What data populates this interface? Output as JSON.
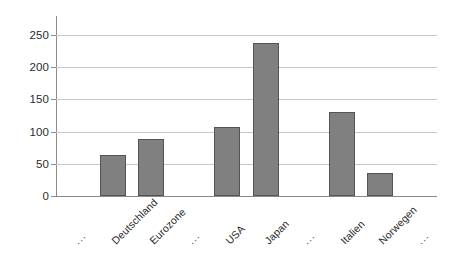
{
  "chart_data": {
    "type": "bar",
    "title": "",
    "subtitle": "",
    "xlabel": "",
    "ylabel": "",
    "categories": [
      "...",
      "Deutschland",
      "Eurozone",
      "...",
      "USA",
      "Japan",
      "...",
      "Italien",
      "Norwegen",
      "..."
    ],
    "values": [
      null,
      63,
      88,
      null,
      107,
      238,
      null,
      130,
      36,
      null
    ],
    "ylim": [
      0,
      265
    ],
    "yticks": [
      0,
      50,
      100,
      150,
      200,
      250
    ],
    "ytick_labels": [
      "0",
      "50",
      "100",
      "150",
      "200",
      "250"
    ],
    "grid": true,
    "legend": false,
    "legend_position": "none",
    "bar_color": "#808080",
    "bar_edge_color": "#545454",
    "gridline_color": "#c8c8c8",
    "axis_color": "#8a8a8a",
    "background_color": "#ffffff",
    "series": [
      {
        "name": "",
        "values": [
          null,
          63,
          88,
          null,
          107,
          238,
          null,
          130,
          36,
          null
        ]
      }
    ],
    "bars": [
      {
        "label": "...",
        "value": null,
        "is_placeholder": true
      },
      {
        "label": "Deutschland",
        "value": 63,
        "is_placeholder": false
      },
      {
        "label": "Eurozone",
        "value": 88,
        "is_placeholder": false
      },
      {
        "label": "...",
        "value": null,
        "is_placeholder": true
      },
      {
        "label": "USA",
        "value": 107,
        "is_placeholder": false
      },
      {
        "label": "Japan",
        "value": 238,
        "is_placeholder": false
      },
      {
        "label": "...",
        "value": null,
        "is_placeholder": true
      },
      {
        "label": "Italien",
        "value": 130,
        "is_placeholder": false
      },
      {
        "label": "Norwegen",
        "value": 36,
        "is_placeholder": false
      },
      {
        "label": "...",
        "value": null,
        "is_placeholder": true
      }
    ]
  },
  "axis": {
    "ticks": [
      {
        "label": "250",
        "value": 250
      },
      {
        "label": "200",
        "value": 200
      },
      {
        "label": "150",
        "value": 150
      },
      {
        "label": "100",
        "value": 100
      },
      {
        "label": "50",
        "value": 50
      },
      {
        "label": "0",
        "value": 0
      }
    ]
  }
}
